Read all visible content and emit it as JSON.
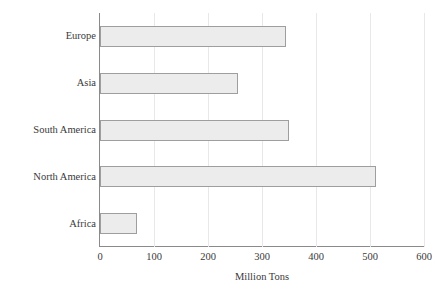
{
  "chart_data": {
    "type": "bar",
    "orientation": "horizontal",
    "title": "",
    "xlabel": "Million Tons",
    "ylabel": "",
    "categories": [
      "Europe",
      "Asia",
      "South America",
      "North America",
      "Africa"
    ],
    "values": [
      345,
      255,
      350,
      512,
      68
    ],
    "series": [
      {
        "name": "Million Tons",
        "values": [
          345,
          255,
          350,
          512,
          68
        ]
      }
    ],
    "xlim": [
      0,
      600
    ],
    "xticks": [
      0,
      100,
      200,
      300,
      400,
      500,
      600
    ],
    "xtick_labels": [
      "0",
      "100",
      "200",
      "300",
      "400",
      "500",
      "600"
    ],
    "grid": "vertical",
    "legend": "none",
    "colors": {
      "bar_fill": "#ececec",
      "bar_border": "#9e9e9e",
      "axis": "#8a8a8a",
      "gridline": "#e8e8e8",
      "text": "#3a3a3a",
      "background": "#ffffff"
    }
  }
}
